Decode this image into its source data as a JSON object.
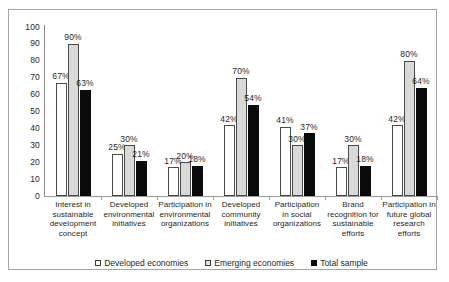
{
  "chart_data": {
    "type": "bar",
    "title": "",
    "xlabel": "",
    "ylabel": "",
    "ylim": [
      0,
      100
    ],
    "yticks": [
      100,
      90,
      80,
      70,
      60,
      50,
      40,
      30,
      20,
      10,
      0
    ],
    "grid": false,
    "legend_position": "bottom-center",
    "value_suffix": "%",
    "categories": [
      "Interest in sustainable development concept",
      "Developed environmental initiatives",
      "Participation in environmental organizations",
      "Developed community initiatives",
      "Participation in social organizations",
      "Brand recognition for sustainable efforts",
      "Participation in future global research efforts"
    ],
    "category_lines": [
      [
        "Interest in",
        "sustainable",
        "development",
        "concept"
      ],
      [
        "Developed",
        "environmental",
        "initiatives"
      ],
      [
        "Participation in",
        "environmental",
        "organizations"
      ],
      [
        "Developed",
        "community",
        "initiatives"
      ],
      [
        "Participation",
        "in social",
        "organizations"
      ],
      [
        "Brand",
        "recognition for",
        "sustainable",
        "efforts"
      ],
      [
        "Participation in",
        "future global",
        "research efforts"
      ]
    ],
    "series": [
      {
        "name": "Developed economies",
        "color": "#ffffff",
        "values": [
          67,
          25,
          17,
          42,
          41,
          17,
          42
        ],
        "labels": [
          "67%",
          "25%",
          "17%",
          "42%",
          "41%",
          "17%",
          "42%"
        ]
      },
      {
        "name": "Emerging economies",
        "color": "#d9d9d9",
        "values": [
          90,
          30,
          20,
          70,
          30,
          30,
          80
        ],
        "labels": [
          "90%",
          "30%",
          "20%",
          "70%",
          "30%",
          "30%",
          "80%"
        ]
      },
      {
        "name": "Total sample",
        "color": "#0b0b0b",
        "values": [
          63,
          21,
          18,
          54,
          37,
          18,
          64
        ],
        "labels": [
          "63%",
          "21%",
          "18%",
          "54%",
          "37%",
          "18%",
          "64%"
        ]
      }
    ]
  }
}
